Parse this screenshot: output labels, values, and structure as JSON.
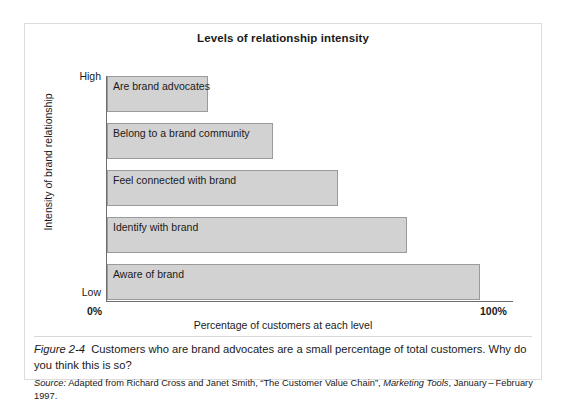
{
  "figure": {
    "number": "Figure 2-4",
    "caption": "Customers who are brand advocates are a small percentage of total customers. Why do you think this is so?",
    "source_label": "Source:",
    "source_text_before": "Adapted from Richard Cross and Janet Smith, “The Customer Value Chain”,",
    "source_publication": "Marketing Tools",
    "source_text_after": ", January – February 1997."
  },
  "chart_data": {
    "type": "bar",
    "orientation": "horizontal",
    "title": "Levels of relationship intensity",
    "xlabel": "Percentage of customers at each level",
    "ylabel": "Intensity of brand relationship",
    "xlim": [
      0,
      100
    ],
    "xtick_labels": [
      "0%",
      "100%"
    ],
    "ytick_labels": [
      "High",
      "Low"
    ],
    "grid": false,
    "legend": false,
    "bar_fill_color": "#d2d2d2",
    "bar_border_color": "#9a9a9a",
    "categories": [
      "Are brand advocates",
      "Belong to a brand community",
      "Feel connected with brand",
      "Identify with brand",
      "Aware of brand"
    ],
    "values": [
      25,
      41,
      57,
      74,
      92
    ],
    "bars": [
      {
        "label": "Are brand advocates",
        "value": 25
      },
      {
        "label": "Belong to a brand community",
        "value": 41
      },
      {
        "label": "Feel connected with brand",
        "value": 57
      },
      {
        "label": "Identify with brand",
        "value": 74
      },
      {
        "label": "Aware of brand",
        "value": 92
      }
    ]
  }
}
